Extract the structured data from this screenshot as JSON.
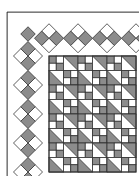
{
  "caption": "Jacob's Ladder design.",
  "colors": {
    "dark": "#8c8c8c",
    "light": "#ffffff",
    "line": "#333333"
  },
  "grid": {
    "cell": 14.5,
    "origin_x": 49,
    "origin_y": 56,
    "cells": [
      [
        "F1",
        "T1",
        "F1",
        "T1",
        "F1",
        "T1"
      ],
      [
        "T2",
        "F1",
        "T2",
        "F1",
        "T2",
        "F1"
      ],
      [
        "F1",
        "T1",
        "F1",
        "T1",
        "F1",
        "T1"
      ],
      [
        "T2",
        "F1",
        "T2",
        "F1",
        "T2",
        "F1"
      ],
      [
        "F1",
        "T1",
        "F1",
        "T1",
        "F1",
        "T1"
      ],
      [
        "T2",
        "F1",
        "T2",
        "F1",
        "T2",
        "F1"
      ],
      [
        "F1",
        "T1",
        "F1",
        "T1",
        "F1",
        "T1"
      ],
      [
        "T2",
        "F1",
        "T2",
        "F1",
        "T2",
        "F1"
      ]
    ]
  }
}
